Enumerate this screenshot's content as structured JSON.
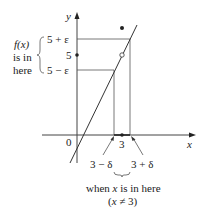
{
  "diagram": {
    "type": "epsilon-delta limit illustration",
    "axes": {
      "x_label": "x",
      "y_label": "y",
      "origin_label": "0"
    },
    "y_ticks": {
      "upper": "5 + ε",
      "center": "5",
      "lower": "5 − ε"
    },
    "x_ticks": {
      "center": "3",
      "left": "3 − δ",
      "right": "3 + δ"
    },
    "left_annotation": {
      "line1": "f(x)",
      "line2": "is in",
      "line3": "here"
    },
    "bottom_annotation": {
      "line1": "when x is in here",
      "line2": "(x ≠ 3)"
    },
    "colors": {
      "line": "#333333",
      "guide": "#555555",
      "text": "#222222"
    }
  }
}
